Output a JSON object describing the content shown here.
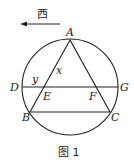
{
  "direction": {
    "label": "西",
    "arrow": {
      "x1": 60,
      "y1": 24,
      "x2": 21,
      "y2": 24
    }
  },
  "circle": {
    "cx": 70,
    "cy": 87,
    "r": 48
  },
  "points": {
    "A": {
      "x": 70,
      "y": 40
    },
    "B": {
      "x": 30,
      "y": 112
    },
    "C": {
      "x": 110,
      "y": 112
    },
    "D": {
      "x": 22,
      "y": 87
    },
    "E": {
      "x": 44,
      "y": 87
    },
    "F": {
      "x": 97,
      "y": 87
    },
    "G": {
      "x": 118,
      "y": 87
    }
  },
  "labels": {
    "A": "A",
    "B": "B",
    "C": "C",
    "D": "D",
    "E": "E",
    "F": "F",
    "G": "G",
    "x": "x",
    "y": "y"
  },
  "caption": "图 1",
  "stroke_color": "#222222"
}
